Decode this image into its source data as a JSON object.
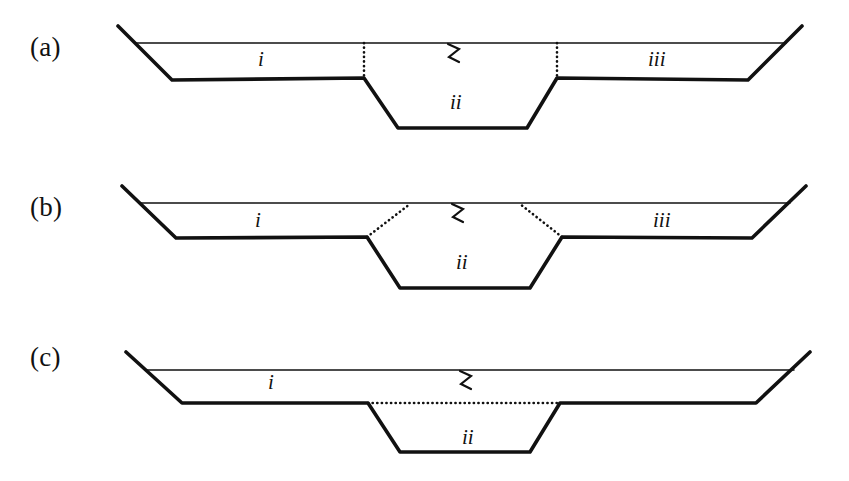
{
  "figure": {
    "background_color": "#ffffff",
    "ink_color": "#111111",
    "width": 849,
    "height": 481,
    "panel_count": 3
  },
  "panels": [
    {
      "id": "a",
      "label": "(a)",
      "boundary_style": "vertical-dotted",
      "labels": [
        {
          "name": "region-i",
          "text": "i",
          "x": 258,
          "y": 47
        },
        {
          "name": "region-ii",
          "text": "ii",
          "x": 450,
          "y": 90
        },
        {
          "name": "region-iii",
          "text": "iii",
          "x": 648,
          "y": 47
        }
      ],
      "break_symbol": {
        "name": "zigzag-break-symbol",
        "text": "∿",
        "x": 452,
        "y": 36
      }
    },
    {
      "id": "b",
      "label": "(b)",
      "boundary_style": "slanted-dotted",
      "labels": [
        {
          "name": "region-i",
          "text": "i",
          "x": 255,
          "y": 208
        },
        {
          "name": "region-ii",
          "text": "ii",
          "x": 456,
          "y": 250
        },
        {
          "name": "region-iii",
          "text": "iii",
          "x": 653,
          "y": 208
        }
      ],
      "break_symbol": {
        "name": "zigzag-break-symbol",
        "text": "∿",
        "x": 456,
        "y": 198
      }
    },
    {
      "id": "c",
      "label": "(c)",
      "boundary_style": "horizontal-dotted",
      "labels": [
        {
          "name": "region-i",
          "text": "i",
          "x": 268,
          "y": 370
        },
        {
          "name": "region-ii",
          "text": "ii",
          "x": 462,
          "y": 425
        }
      ],
      "break_symbol": {
        "name": "zigzag-break-symbol",
        "text": "∿",
        "x": 464,
        "y": 360
      }
    }
  ],
  "chart_data": {
    "type": "diagram",
    "units": [
      {
        "symbol": "i",
        "meaning": "upper left/overlying fill unit"
      },
      {
        "symbol": "ii",
        "meaning": "inner channel fill unit"
      },
      {
        "symbol": "iii",
        "meaning": "upper right fill unit"
      }
    ],
    "panels": [
      {
        "id": "a",
        "label": "(a)",
        "contacts": "two vertical dotted contacts bounding unit ii",
        "units_present": [
          "i",
          "ii",
          "iii"
        ],
        "outline_points": [
          [
            118,
            26
          ],
          [
            172,
            80
          ],
          [
            364,
            78
          ],
          [
            398,
            128
          ],
          [
            527,
            128
          ],
          [
            557,
            78
          ],
          [
            748,
            80
          ],
          [
            802,
            26
          ]
        ],
        "top_line": [
          [
            135,
            43
          ],
          [
            786,
            43
          ]
        ],
        "dotted_segments": [
          [
            [
              364,
              43
            ],
            [
              364,
              78
            ]
          ],
          [
            [
              557,
              43
            ],
            [
              557,
              78
            ]
          ]
        ]
      },
      {
        "id": "b",
        "label": "(b)",
        "contacts": "two slanted dotted contacts flaring outward to the top line",
        "units_present": [
          "i",
          "ii",
          "iii"
        ],
        "outline_points": [
          [
            122,
            186
          ],
          [
            176,
            238
          ],
          [
            367,
            237
          ],
          [
            400,
            288
          ],
          [
            530,
            288
          ],
          [
            562,
            237
          ],
          [
            752,
            238
          ],
          [
            806,
            186
          ]
        ],
        "top_line": [
          [
            139,
            203
          ],
          [
            790,
            203
          ]
        ],
        "dotted_segments": [
          [
            [
              367,
              237
            ],
            [
              410,
              204
            ]
          ],
          [
            [
              562,
              237
            ],
            [
              520,
              204
            ]
          ]
        ]
      },
      {
        "id": "c",
        "label": "(c)",
        "contacts": "single horizontal dotted contact across the top of unit ii",
        "units_present": [
          "i",
          "ii"
        ],
        "outline_points": [
          [
            126,
            352
          ],
          [
            182,
            403
          ],
          [
            368,
            403
          ],
          [
            400,
            452
          ],
          [
            530,
            452
          ],
          [
            560,
            403
          ],
          [
            756,
            403
          ],
          [
            810,
            352
          ]
        ],
        "top_line": [
          [
            145,
            370
          ],
          [
            794,
            370
          ]
        ],
        "dotted_segments": [
          [
            [
              368,
              403
            ],
            [
              560,
              403
            ]
          ]
        ]
      }
    ]
  }
}
